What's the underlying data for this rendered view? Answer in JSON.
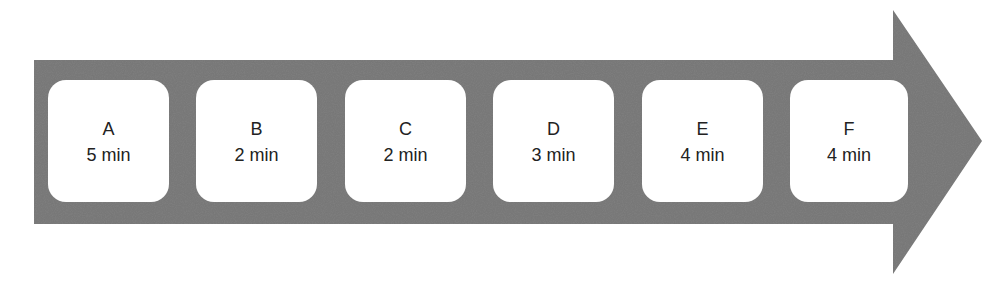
{
  "diagram": {
    "type": "process-flow-arrow",
    "colors": {
      "arrow_fill": "#7d7d7d",
      "box_fill": "#ffffff",
      "text": "#222222"
    },
    "steps": [
      {
        "label": "A",
        "duration": "5 min"
      },
      {
        "label": "B",
        "duration": "2 min"
      },
      {
        "label": "C",
        "duration": "2 min"
      },
      {
        "label": "D",
        "duration": "3 min"
      },
      {
        "label": "E",
        "duration": "4 min"
      },
      {
        "label": "F",
        "duration": "4 min"
      }
    ]
  }
}
